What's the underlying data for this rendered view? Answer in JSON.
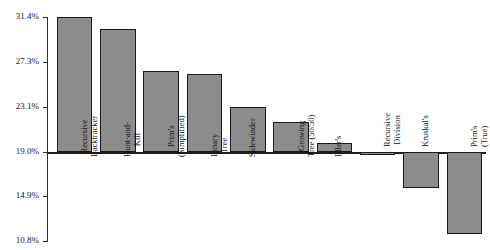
{
  "chart_data": {
    "type": "bar",
    "title": "",
    "xlabel": "",
    "ylabel": "",
    "ylim": [
      10.8,
      31.4
    ],
    "baseline": 19.0,
    "grid": false,
    "legend": null,
    "ytick_labels": [
      "31.4%",
      "27.3%",
      "23.1%",
      "19.0%",
      "14.9%",
      "10.8%"
    ],
    "ytick_values": [
      31.4,
      27.3,
      23.1,
      19.0,
      14.9,
      10.8
    ],
    "categories": [
      "Recursive Backtracker",
      "Hunt-and-Kill",
      "Prim's (Simplified)",
      "Binary Tree",
      "Sidewinder",
      "Growing Tree (50/50)",
      "Eller's",
      "Recursive Division",
      "Kruskal's",
      "Prim's (True)"
    ],
    "category_lines": [
      [
        "Recursive",
        "Backtracker"
      ],
      [
        "Hunt-and-",
        "Kill"
      ],
      [
        "Prim's",
        "(Simplified)"
      ],
      [
        "Binary",
        "Tree"
      ],
      [
        "Sidewinder"
      ],
      [
        "Growing",
        "Tree (50/50)"
      ],
      [
        "Eller's"
      ],
      [
        "Recursive",
        "Division"
      ],
      [
        "Kruskal's"
      ],
      [
        "Prim's",
        "(True)"
      ]
    ],
    "values": [
      31.4,
      30.3,
      26.4,
      26.2,
      23.1,
      21.7,
      19.8,
      18.7,
      15.7,
      11.4
    ]
  },
  "colors": {
    "bar_fill": "#8c8c8c",
    "bar_stroke": "#1a1a1a",
    "axis": "#2b2b2b",
    "text": "#141414",
    "background": "#ffffff"
  }
}
